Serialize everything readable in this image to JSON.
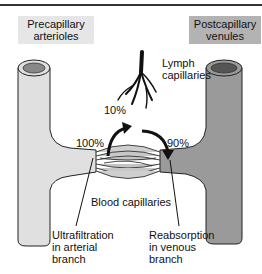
{
  "diagram": {
    "labels": {
      "precapillary": [
        "Precapillary",
        "arterioles"
      ],
      "postcapillary": [
        "Postcapillary",
        "venules"
      ],
      "lymph": [
        "Lymph",
        "capillaries"
      ],
      "pct_lymph": "10%",
      "pct_in": "100%",
      "pct_out": "90%",
      "blood_capillaries": "Blood capillaries",
      "ultrafiltration": [
        "Ultrafiltration",
        "in arterial",
        "branch"
      ],
      "reabsorption": [
        "Reabsorption",
        "in venous",
        "branch"
      ]
    },
    "colors": {
      "arteriole": "#e0e0e0",
      "venule": "#9a9a9a",
      "outline": "#222222",
      "pre_box": "#e6e6e6",
      "post_box": "#b3b3b3"
    }
  }
}
